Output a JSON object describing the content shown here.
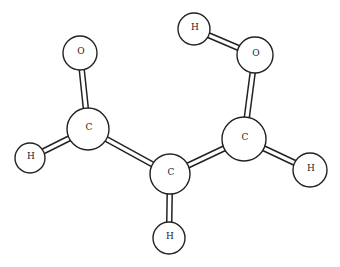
{
  "diagram": {
    "type": "ball-and-stick molecular model",
    "colors": {
      "stroke": "#222222",
      "fill": "#ffffff",
      "background": "#ffffff"
    },
    "atoms": [
      {
        "id": "O1",
        "label": "O",
        "x": 80,
        "y": 53,
        "r": 17
      },
      {
        "id": "C1",
        "label": "C",
        "x": 88,
        "y": 129,
        "r": 21
      },
      {
        "id": "H1",
        "label": "H",
        "x": 30,
        "y": 158,
        "r": 15
      },
      {
        "id": "C2",
        "label": "C",
        "x": 170,
        "y": 174,
        "r": 20
      },
      {
        "id": "H2",
        "label": "H",
        "x": 169,
        "y": 238,
        "r": 16
      },
      {
        "id": "C3",
        "label": "C",
        "x": 244,
        "y": 139,
        "r": 22
      },
      {
        "id": "H3",
        "label": "H",
        "x": 310,
        "y": 170,
        "r": 17
      },
      {
        "id": "O2",
        "label": "O",
        "x": 255,
        "y": 55,
        "r": 18
      },
      {
        "id": "H4",
        "label": "H",
        "x": 194,
        "y": 29,
        "r": 16
      }
    ],
    "bonds": [
      {
        "from": "O1",
        "to": "C1"
      },
      {
        "from": "C1",
        "to": "H1"
      },
      {
        "from": "C1",
        "to": "C2"
      },
      {
        "from": "C2",
        "to": "H2"
      },
      {
        "from": "C2",
        "to": "C3"
      },
      {
        "from": "C3",
        "to": "H3"
      },
      {
        "from": "C3",
        "to": "O2"
      },
      {
        "from": "O2",
        "to": "H4"
      }
    ]
  }
}
